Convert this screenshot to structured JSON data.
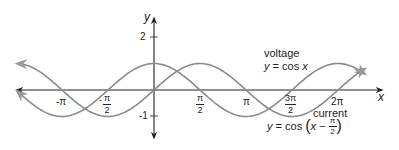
{
  "chart_data": {
    "type": "line",
    "title": "",
    "xlabel": "x",
    "ylabel": "y",
    "xlim": [
      -4.1,
      7.3
    ],
    "ylim": [
      -1.8,
      2.8
    ],
    "grid": false,
    "x_ticks": [
      {
        "value": -3.14159,
        "label": "-π"
      },
      {
        "value": -1.5708,
        "label": "-π/2",
        "num": "π",
        "den": "2",
        "sign": "-"
      },
      {
        "value": 1.5708,
        "label": "π/2",
        "num": "π",
        "den": "2",
        "sign": ""
      },
      {
        "value": 3.14159,
        "label": "π"
      },
      {
        "value": 4.7124,
        "label": "3π/2",
        "num": "3π",
        "den": "2",
        "sign": ""
      },
      {
        "value": 6.28318,
        "label": "2π"
      }
    ],
    "y_ticks": [
      {
        "value": 2,
        "label": "2"
      },
      {
        "value": -1,
        "label": "-1"
      }
    ],
    "series": [
      {
        "name": "voltage",
        "equation": "y = cos x",
        "function": "cos(x)",
        "color": "#8a8a8a"
      },
      {
        "name": "current",
        "equation": "y = cos (x − π/2)",
        "function": "cos(x - pi/2)",
        "color": "#8a8a8a"
      }
    ],
    "annotations": [
      {
        "text": "voltage",
        "sub": "y = cos x"
      },
      {
        "text": "current",
        "sub": "y = cos (x − π/2)"
      }
    ]
  },
  "labels": {
    "x_axis": "x",
    "y_axis": "y",
    "tick_neg_pi": "-π",
    "tick_neg_half_pi_num": "π",
    "tick_neg_half_pi_den": "2",
    "tick_neg_half_pi_sign": "-",
    "tick_half_pi_num": "π",
    "tick_half_pi_den": "2",
    "tick_pi": "π",
    "tick_three_half_pi_num": "3π",
    "tick_three_half_pi_den": "2",
    "tick_two_pi": "2π",
    "tick_y_2": "2",
    "tick_y_neg1": "-1",
    "voltage_title": "voltage",
    "voltage_eq_y": "y",
    "voltage_eq_rest": " = cos ",
    "voltage_eq_x": "x",
    "current_title": "current",
    "current_eq_y": "y",
    "current_eq_mid": " = cos ",
    "current_eq_open": "(",
    "current_eq_x": "x",
    "current_eq_minus": " − ",
    "current_eq_num": "π",
    "current_eq_den": "2",
    "current_eq_close": ")"
  },
  "colors": {
    "axis": "#222222",
    "curve": "#8a8a8a"
  }
}
